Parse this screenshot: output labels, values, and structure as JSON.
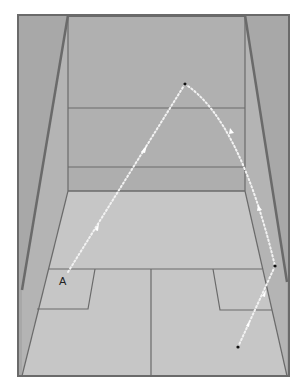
{
  "diagram": {
    "labels": {
      "player_position": "A"
    },
    "colors": {
      "side_wall": "#a9a9a9",
      "front_wall": "#b0b0b0",
      "tin_band": "#aaaaaa",
      "floor": "#c4c4c4",
      "court_lines": "#6a6a6a",
      "trajectory": "#f4f4f4",
      "point": "#111111",
      "background": "#ffffff"
    },
    "trajectory": {
      "style": "dotted",
      "segments": [
        {
          "name": "A-to-front-wall",
          "direction": "toward front wall"
        },
        {
          "name": "front-wall-to-side-wall",
          "direction": "down right"
        },
        {
          "name": "side-wall-to-floor",
          "direction": "down left"
        }
      ],
      "points": [
        "A",
        "front-wall-hit",
        "side-wall-hit",
        "floor-bounce"
      ]
    }
  }
}
